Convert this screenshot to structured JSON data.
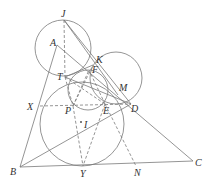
{
  "diagram": {
    "points": {
      "J": [
        64,
        20
      ],
      "A": [
        57,
        45
      ],
      "K": [
        93,
        65
      ],
      "F": [
        89,
        70
      ],
      "T": [
        65,
        77
      ],
      "M": [
        118,
        95
      ],
      "D": [
        131,
        104
      ],
      "X": [
        40,
        106
      ],
      "P": [
        73,
        106
      ],
      "E": [
        105,
        104
      ],
      "I": [
        81,
        122
      ],
      "B": [
        20,
        167
      ],
      "Y": [
        83,
        166
      ],
      "N": [
        136,
        166
      ],
      "C": [
        193,
        161
      ]
    },
    "labels": [
      {
        "text": "J",
        "x": 61,
        "y": 17
      },
      {
        "text": "A",
        "x": 50,
        "y": 46
      },
      {
        "text": "K",
        "x": 96,
        "y": 63
      },
      {
        "text": "F",
        "x": 92,
        "y": 73
      },
      {
        "text": "T",
        "x": 57,
        "y": 80
      },
      {
        "text": "M",
        "x": 119,
        "y": 91
      },
      {
        "text": "D",
        "x": 131,
        "y": 112
      },
      {
        "text": "X",
        "x": 27,
        "y": 110
      },
      {
        "text": "P",
        "x": 65,
        "y": 114
      },
      {
        "text": "E",
        "x": 103,
        "y": 114
      },
      {
        "text": "I",
        "x": 84,
        "y": 128
      },
      {
        "text": "B",
        "x": 10,
        "y": 175
      },
      {
        "text": "Y",
        "x": 80,
        "y": 177
      },
      {
        "text": "N",
        "x": 134,
        "y": 176
      },
      {
        "text": "C",
        "x": 195,
        "y": 166
      }
    ],
    "stroke_color": "#777777"
  }
}
